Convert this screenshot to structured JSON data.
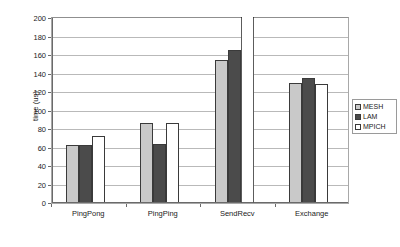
{
  "chart_data": {
    "type": "bar",
    "title": "",
    "subtitle": "",
    "xlabel": "",
    "ylabel": "time (us)",
    "categories": [
      "PingPong",
      "PingPing",
      "SendRecv",
      "Exchange"
    ],
    "series": [
      {
        "name": "MESH",
        "color": "#c9c9c9",
        "values": [
          62,
          85,
          154,
          129
        ]
      },
      {
        "name": "LAM",
        "color": "#4b4b4b",
        "values": [
          62,
          63,
          164,
          134
        ]
      },
      {
        "name": "MPICH",
        "color": "#ffffff",
        "values": [
          71,
          85,
          205,
          128
        ]
      }
    ],
    "ylim": [
      0,
      200
    ],
    "ytick_labels": [
      "0",
      "20",
      "40",
      "60",
      "80",
      "100",
      "120",
      "140",
      "160",
      "180",
      "200"
    ],
    "ytick_values": [
      0,
      20,
      40,
      60,
      80,
      100,
      120,
      140,
      160,
      180,
      200
    ],
    "grid": true,
    "grid_axis": "y",
    "legend": {
      "position": "right",
      "entries": [
        {
          "label": "MESH",
          "swatch": "light-gray"
        },
        {
          "label": "LAM",
          "swatch": "dark-gray"
        },
        {
          "label": "MPICH",
          "swatch": "white"
        }
      ]
    }
  }
}
